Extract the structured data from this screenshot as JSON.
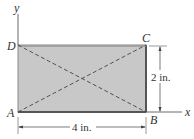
{
  "diagram": {
    "points": {
      "A": "A",
      "B": "B",
      "C": "C",
      "D": "D"
    },
    "axes": {
      "x_label": "x",
      "y_label": "y"
    },
    "dimensions": {
      "width": "4 in.",
      "height": "2 in."
    },
    "colors": {
      "fill": "#c8c8c8",
      "edge": "#555555",
      "line": "#444444",
      "text": "#333333"
    }
  }
}
